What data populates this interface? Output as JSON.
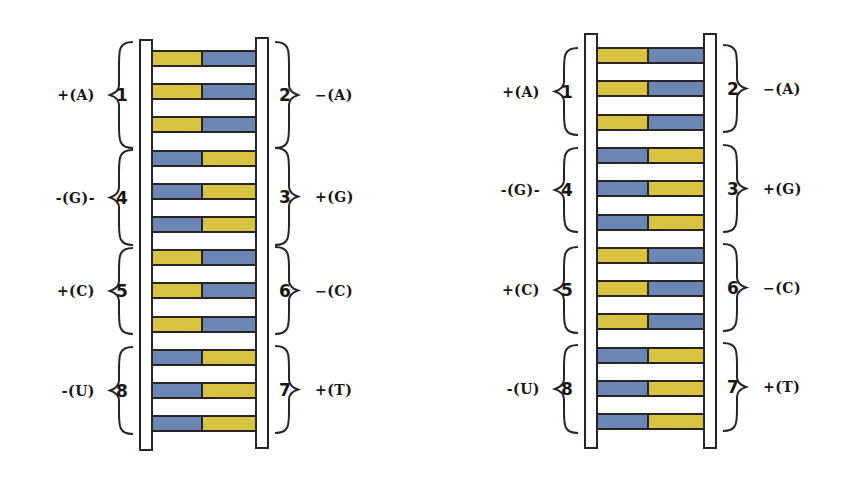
{
  "colors": {
    "yellow": "#D9C441",
    "blue": "#6B86B5",
    "outline": "#2a2323",
    "rail_fill": "#ffffff"
  },
  "ladders": [
    {
      "id": "left",
      "left_rail": {
        "x": 139,
        "y": 39,
        "w": 14,
        "h": 412
      },
      "right_rail": {
        "x": 255,
        "y": 37,
        "w": 14,
        "h": 412
      },
      "rung_x": 151,
      "rung_w": 106,
      "rung_start_y": 50,
      "rung_pitch": 33.2,
      "split": 0.49,
      "rungs": [
        "yellow-blue",
        "yellow-blue",
        "yellow-blue",
        "blue-yellow",
        "blue-yellow",
        "blue-yellow",
        "yellow-blue",
        "yellow-blue",
        "yellow-blue",
        "blue-yellow",
        "blue-yellow",
        "blue-yellow"
      ],
      "groups": [
        {
          "side": "left",
          "number": "1",
          "label": "+(A)",
          "y_top": 42,
          "y_bot": 148
        },
        {
          "side": "right",
          "number": "2",
          "label": "−(A)",
          "y_top": 42,
          "y_bot": 148
        },
        {
          "side": "left",
          "number": "4",
          "label": "-(G)-",
          "y_top": 150,
          "y_bot": 245
        },
        {
          "side": "right",
          "number": "3",
          "label": "+(G)",
          "y_top": 148,
          "y_bot": 245
        },
        {
          "side": "left",
          "number": "5",
          "label": "+(C)",
          "y_top": 248,
          "y_bot": 334
        },
        {
          "side": "right",
          "number": "6",
          "label": "−(C)",
          "y_top": 247,
          "y_bot": 334
        },
        {
          "side": "left",
          "number": "8",
          "label": "-(U)",
          "y_top": 347,
          "y_bot": 434
        },
        {
          "side": "right",
          "number": "7",
          "label": "+(T)",
          "y_top": 346,
          "y_bot": 433
        }
      ]
    },
    {
      "id": "right",
      "left_rail": {
        "x": 584,
        "y": 33,
        "w": 14,
        "h": 416
      },
      "right_rail": {
        "x": 703,
        "y": 33,
        "w": 14,
        "h": 416
      },
      "rung_x": 596,
      "rung_w": 109,
      "rung_start_y": 47,
      "rung_pitch": 33.3,
      "split": 0.49,
      "rungs": [
        "yellow-blue",
        "yellow-blue",
        "yellow-blue",
        "blue-yellow",
        "blue-yellow",
        "blue-yellow",
        "yellow-blue",
        "yellow-blue",
        "yellow-blue",
        "blue-yellow",
        "blue-yellow",
        "blue-yellow"
      ],
      "groups": [
        {
          "side": "left",
          "number": "1",
          "label": "+(A)",
          "y_top": 48,
          "y_bot": 135
        },
        {
          "side": "right",
          "number": "2",
          "label": "−(A)",
          "y_top": 45,
          "y_bot": 132
        },
        {
          "side": "left",
          "number": "4",
          "label": "-(G)-",
          "y_top": 148,
          "y_bot": 232
        },
        {
          "side": "right",
          "number": "3",
          "label": "+(G)",
          "y_top": 145,
          "y_bot": 232
        },
        {
          "side": "left",
          "number": "5",
          "label": "+(C)",
          "y_top": 247,
          "y_bot": 333
        },
        {
          "side": "right",
          "number": "6",
          "label": "−(C)",
          "y_top": 244,
          "y_bot": 331
        },
        {
          "side": "left",
          "number": "8",
          "label": "-(U)",
          "y_top": 345,
          "y_bot": 433
        },
        {
          "side": "right",
          "number": "7",
          "label": "+(T)",
          "y_top": 343,
          "y_bot": 431
        }
      ]
    }
  ]
}
